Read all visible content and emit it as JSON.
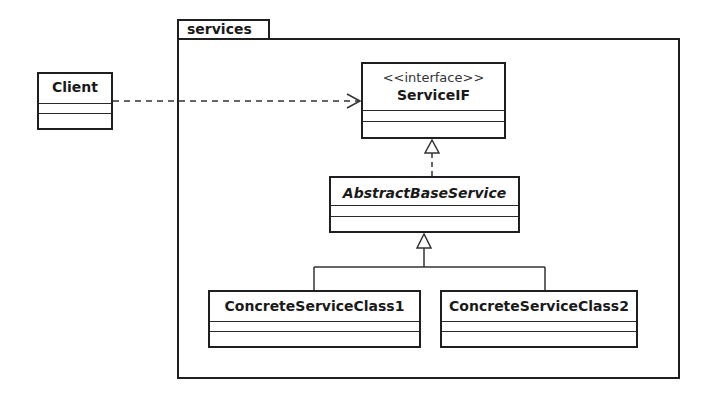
{
  "diagram": {
    "type": "uml-class-diagram",
    "package": {
      "name": "services"
    },
    "classes": {
      "client": {
        "name": "Client",
        "stereotype": null,
        "italic": false
      },
      "service_if": {
        "name": "ServiceIF",
        "stereotype": "<<interface>>",
        "italic": false
      },
      "abstract_base": {
        "name": "AbstractBaseService",
        "stereotype": null,
        "italic": true
      },
      "concrete1": {
        "name": "ConcreteServiceClass1",
        "stereotype": null,
        "italic": false
      },
      "concrete2": {
        "name": "ConcreteServiceClass2",
        "stereotype": null,
        "italic": false
      }
    },
    "relationships": [
      {
        "from": "Client",
        "to": "ServiceIF",
        "kind": "dependency",
        "style": "dashed-open-arrow"
      },
      {
        "from": "AbstractBaseService",
        "to": "ServiceIF",
        "kind": "realization",
        "style": "dashed-hollow-triangle"
      },
      {
        "from": "ConcreteServiceClass1",
        "to": "AbstractBaseService",
        "kind": "generalization",
        "style": "solid-hollow-triangle"
      },
      {
        "from": "ConcreteServiceClass2",
        "to": "AbstractBaseService",
        "kind": "generalization",
        "style": "solid-hollow-triangle"
      }
    ]
  }
}
